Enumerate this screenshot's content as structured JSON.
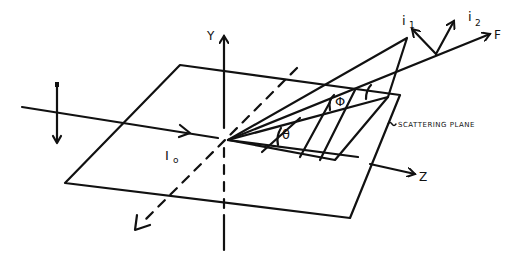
{
  "diagram": {
    "labels": {
      "y_axis": "Y",
      "z_axis": "Z",
      "incident": "I",
      "incident_sub": "o",
      "theta": "θ",
      "phi": "Φ",
      "i1": "i",
      "i1_sub": "1",
      "i2": "i",
      "i2_sub": "2",
      "F": "F",
      "scattering_plane": "SCATTERING PLANE"
    }
  }
}
